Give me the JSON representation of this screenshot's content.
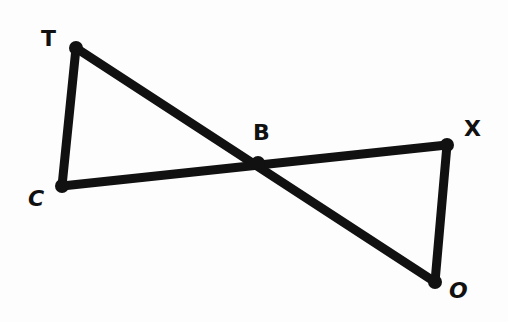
{
  "diagram": {
    "type": "geometry",
    "stroke_color": "#111111",
    "points": {
      "T": {
        "label": "T",
        "x": 76,
        "y": 48
      },
      "C": {
        "label": "C",
        "x": 62,
        "y": 186
      },
      "B": {
        "label": "B",
        "x": 258,
        "y": 163
      },
      "X": {
        "label": "X",
        "x": 447,
        "y": 145
      },
      "O": {
        "label": "O",
        "x": 435,
        "y": 282
      }
    },
    "segments": [
      {
        "from": "T",
        "to": "C"
      },
      {
        "from": "T",
        "to": "O"
      },
      {
        "from": "C",
        "to": "X"
      },
      {
        "from": "X",
        "to": "O"
      }
    ],
    "labels": {
      "T": "T",
      "C": "C",
      "B": "B",
      "X": "X",
      "O": "O"
    }
  }
}
